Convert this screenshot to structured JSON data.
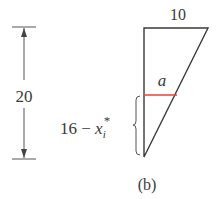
{
  "figure": {
    "caption": "(b)",
    "height_label": "20",
    "top_width_label": "10",
    "slice_width_label": "a",
    "distance_label_prefix": "16 − ",
    "distance_label_var": "x",
    "distance_label_sub": "i",
    "distance_label_sup": "*",
    "colors": {
      "lines": "#3a3a3a",
      "slice": "#e8413a",
      "dimension": "#555555"
    }
  }
}
